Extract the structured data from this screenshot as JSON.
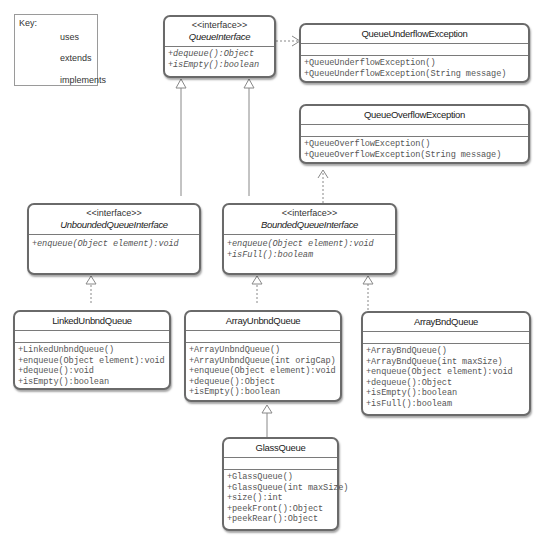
{
  "key": {
    "title": "Key:",
    "items": [
      {
        "label": "uses",
        "line": "dashed",
        "arrow": "open"
      },
      {
        "label": "extends",
        "line": "solid",
        "arrow": "hollow-triangle"
      },
      {
        "label": "implements",
        "line": "dashed",
        "arrow": "hollow-triangle"
      }
    ]
  },
  "classes": {
    "queue_interface": {
      "stereotype": "<<interface>>",
      "name": "QueueInterface",
      "ops": [
        "+dequeue():Object",
        "+isEmpty():boolean"
      ]
    },
    "underflow": {
      "name": "QueueUnderflowException",
      "ops": [
        "+QueueUnderflowException()",
        "+QueueUnderflowException(String message)"
      ]
    },
    "overflow": {
      "name": "QueueOverflowException",
      "ops": [
        "+QueueOverflowException()",
        "+QueueOverflowException(String message)"
      ]
    },
    "unbounded_interface": {
      "stereotype": "<<interface>>",
      "name": "UnboundedQueueInterface",
      "ops": [
        "+enqueue(Object element):void"
      ]
    },
    "bounded_interface": {
      "stereotype": "<<interface>>",
      "name": "BoundedQueueInterface",
      "ops": [
        "+enqueue(Object element):void",
        "+isFull():booleam"
      ]
    },
    "linked_unbnd": {
      "name": "LinkedUnbndQueue",
      "ops": [
        "+LinkedUnbndQueue()",
        "+enqueue(Object element):void",
        "+dequeue():void",
        "+isEmpty():boolean"
      ]
    },
    "array_unbnd": {
      "name": "ArrayUnbndQueue",
      "ops": [
        "+ArrayUnbndQueue()",
        "+ArrayUnbndQueue(int origCap)",
        "+enqueue(Object element):void",
        "+dequeue():Object",
        "+isEmpty():boolean"
      ]
    },
    "array_bnd": {
      "name": "ArrayBndQueue",
      "ops": [
        "+ArrayBndQueue()",
        "+ArrayBndQueue(int maxSize)",
        "+enqueue(Object element):void",
        "+dequeue():Object",
        "+isEmpty():boolean",
        "+isFull():booleam"
      ]
    },
    "glass": {
      "name": "GlassQueue",
      "ops": [
        "+GlassQueue()",
        "+GlassQueue(int maxSize)",
        "+size():int",
        "+peekFront():Object",
        "+peekRear():Object"
      ]
    }
  },
  "relations": [
    {
      "from": "QueueInterface",
      "to": "QueueUnderflowException",
      "type": "uses"
    },
    {
      "from": "BoundedQueueInterface",
      "to": "QueueOverflowException",
      "type": "uses"
    },
    {
      "from": "UnboundedQueueInterface",
      "to": "QueueInterface",
      "type": "extends"
    },
    {
      "from": "BoundedQueueInterface",
      "to": "QueueInterface",
      "type": "extends"
    },
    {
      "from": "LinkedUnbndQueue",
      "to": "UnboundedQueueInterface",
      "type": "implements"
    },
    {
      "from": "ArrayUnbndQueue",
      "to": "BoundedQueueInterface",
      "type": "implements"
    },
    {
      "from": "ArrayBndQueue",
      "to": "BoundedQueueInterface",
      "type": "implements"
    },
    {
      "from": "GlassQueue",
      "to": "ArrayUnbndQueue",
      "type": "extends"
    }
  ]
}
